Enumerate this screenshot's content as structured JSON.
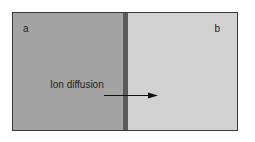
{
  "diagram": {
    "compartments": [
      {
        "id": "a",
        "label": "a",
        "color": "#a3a3a3"
      },
      {
        "id": "b",
        "label": "b",
        "color": "#d2d2d2"
      }
    ],
    "membrane": {
      "color": "#5a5a5a"
    },
    "arrow": {
      "label": "Ion diffusion",
      "direction": "a-to-b"
    }
  }
}
